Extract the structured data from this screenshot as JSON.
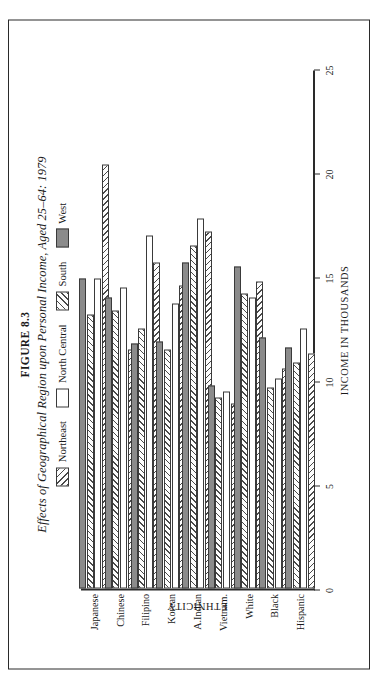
{
  "figure": {
    "number": "FIGURE 8.3",
    "title": "Effects of Geographical Region upon Personal Income, Aged 25–64: 1979"
  },
  "legend": {
    "position": "top-center",
    "entries": [
      {
        "label": "Northeast",
        "pattern": "hatch-right",
        "swatch_class": "sw-ne"
      },
      {
        "label": "North Central",
        "pattern": "empty",
        "swatch_class": "sw-nc"
      },
      {
        "label": "South",
        "pattern": "hatch-left",
        "swatch_class": "sw-s"
      },
      {
        "label": "West",
        "pattern": "solid-gray",
        "swatch_class": "sw-w"
      }
    ]
  },
  "chart_data": {
    "type": "bar",
    "orientation": "horizontal",
    "title": "Effects of Geographical Region upon Personal Income, Aged 25–64: 1979",
    "xlabel": "INCOME IN THOUSANDS",
    "ylabel": "ETHNICITY",
    "xlim": [
      0,
      25
    ],
    "xticks": [
      0,
      5,
      10,
      15,
      20,
      25
    ],
    "grid": false,
    "legend_position": "top-center",
    "categories": [
      "Japanese",
      "Chinese",
      "Filipino",
      "Korean",
      "A.Indian",
      "Vietnam.",
      "White",
      "Black",
      "Hispanic"
    ],
    "series": [
      {
        "name": "Northeast",
        "pattern": "hatch-right",
        "bar_class": "b-ne",
        "values": [
          20.4,
          11.5,
          15.7,
          14.6,
          17.2,
          8.9,
          14.8,
          10.6,
          11.3
        ]
      },
      {
        "name": "North Central",
        "pattern": "empty",
        "bar_class": "b-nc",
        "values": [
          14.9,
          14.5,
          17.0,
          13.7,
          17.8,
          9.5,
          14.0,
          10.1,
          12.5
        ]
      },
      {
        "name": "South",
        "pattern": "hatch-left",
        "bar_class": "b-s",
        "values": [
          13.2,
          13.4,
          12.5,
          11.5,
          16.5,
          9.2,
          14.2,
          9.7,
          10.9
        ]
      },
      {
        "name": "West",
        "pattern": "solid-gray",
        "bar_class": "b-w",
        "values": [
          14.9,
          14.0,
          11.8,
          11.9,
          15.7,
          9.8,
          15.5,
          12.1,
          11.6
        ]
      }
    ]
  },
  "axes": {
    "value_axis_label": "INCOME IN THOUSANDS",
    "category_axis_label": "ETHNICITY",
    "value_tick_labels": [
      "0",
      "5",
      "10",
      "15",
      "20",
      "25"
    ]
  }
}
